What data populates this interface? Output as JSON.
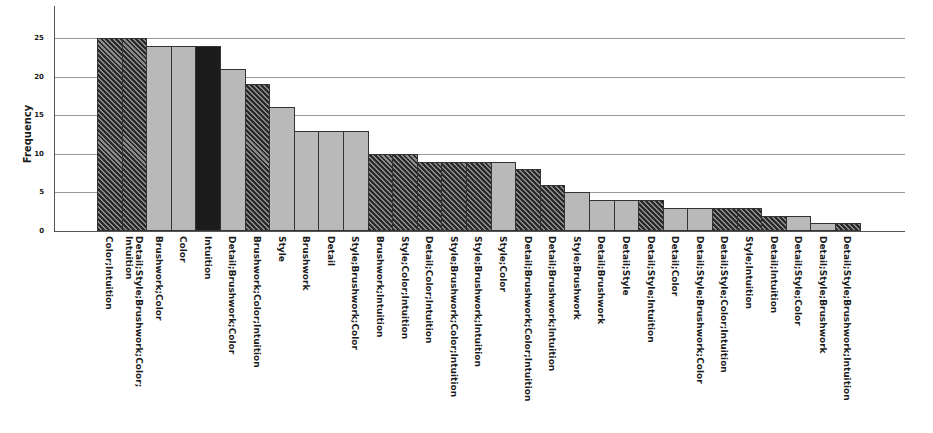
{
  "chart_data": {
    "type": "bar",
    "title": "",
    "xlabel": "",
    "ylabel": "Frequency",
    "ylim": [
      0,
      25
    ],
    "yticks": [
      0,
      5,
      10,
      15,
      20,
      25
    ],
    "grid": true,
    "legend": null,
    "categories": [
      "Color;Intuition",
      "Detail;Style;Brushwork;Color;\nIntuition",
      "Brushwork;Color",
      "Color",
      "Intuition",
      "Detail;Brushwork;Color",
      "Brushwork;Color;Intuition",
      "Style",
      "Brushwork",
      "Detail",
      "Style;Brushwork;Color",
      "Brushwork;Intuition",
      "Style;Color;Intuition",
      "Detail;Color;Intuition",
      "Style;Brushwork;Color;Intuition",
      "Style;Brushwork;Intuition",
      "Style;Color",
      "Detail;Brushwork;Color;Intuition",
      "Detail;Brushwork;Intuition",
      "Style;Brushwork",
      "Detail;Brushwork",
      "Detail;Style",
      "Detail;Style;Intuition",
      "Detail;Color",
      "Detail;Style;Brushwork;Color",
      "Detail;Style;Color;Intuition",
      "Style;Intuition",
      "Detail;Intuition",
      "Detail;Style;Color",
      "Detail;Style;Brushwork",
      "Detail;Style;Brushwork;Intuition"
    ],
    "values": [
      25,
      25,
      24,
      24,
      24,
      21,
      19,
      16,
      13,
      13,
      13,
      10,
      10,
      9,
      9,
      9,
      9,
      8,
      6,
      5,
      4,
      4,
      4,
      3,
      3,
      3,
      3,
      2,
      2,
      1,
      1
    ],
    "fill_styles": [
      "hatched",
      "hatched",
      "solid-light",
      "solid-light",
      "solid-dark",
      "solid-light",
      "hatched",
      "solid-light",
      "solid-light",
      "solid-light",
      "solid-light",
      "hatched",
      "hatched",
      "hatched",
      "hatched",
      "hatched",
      "solid-light",
      "hatched",
      "hatched",
      "solid-light",
      "solid-light",
      "solid-light",
      "hatched",
      "solid-light",
      "solid-light",
      "hatched",
      "hatched",
      "hatched",
      "solid-light",
      "solid-light",
      "hatched"
    ],
    "colors": {
      "solid_light": "#b9b9b9",
      "solid_dark": "#1c1c1c",
      "hatched": "#5a5a5a",
      "grid": "#9a9a9a"
    }
  }
}
